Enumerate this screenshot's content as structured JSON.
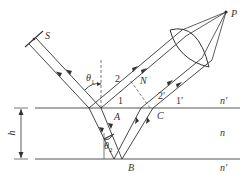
{
  "diagram": {
    "labels": {
      "source": "S",
      "point_p": "P",
      "point_a": "A",
      "point_b": "B",
      "point_c": "C",
      "point_n": "N",
      "theta1": "θ",
      "theta1_sub": "1",
      "theta2": "θ",
      "theta2_sub": "2",
      "ray1": "1",
      "ray2": "2",
      "ray1p": "1′",
      "ray2p": "2′",
      "thickness": "h",
      "n_top": "n′",
      "n_film": "n",
      "n_bottom": "n′"
    },
    "colors": {
      "line": "#333333",
      "surface": "#555555",
      "dashed": "#555555"
    }
  }
}
